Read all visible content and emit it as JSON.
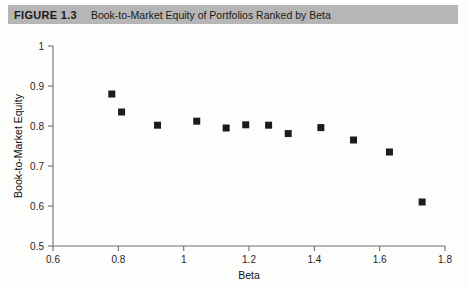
{
  "header": {
    "figure_number": "FIGURE 1.3",
    "title": "Book-to-Market Equity of Portfolios Ranked by Beta",
    "band_color": "#b6b6b6"
  },
  "chart_data": {
    "type": "scatter",
    "title": "Book-to-Market Equity of Portfolios Ranked by Beta",
    "xlabel": "Beta",
    "ylabel": "Book-to-Market Equity",
    "xlim": [
      0.6,
      1.8
    ],
    "ylim": [
      0.5,
      1.0
    ],
    "xticks": [
      0.6,
      0.8,
      1.0,
      1.2,
      1.4,
      1.6,
      1.8
    ],
    "xtick_labels": [
      "0.6",
      "0.8",
      "1",
      "1.2",
      "1.4",
      "1.6",
      "1.8"
    ],
    "yticks": [
      0.5,
      0.6,
      0.7,
      0.8,
      0.9,
      1.0
    ],
    "ytick_labels": [
      "0.5",
      "0.6",
      "0.7",
      "0.8",
      "0.9",
      "1"
    ],
    "grid": false,
    "legend": "none",
    "marker": "square",
    "marker_color": "#1c1c1c",
    "marker_size": 7,
    "x": [
      0.78,
      0.81,
      0.92,
      1.04,
      1.13,
      1.19,
      1.26,
      1.32,
      1.42,
      1.52,
      1.63,
      1.73
    ],
    "y": [
      0.88,
      0.835,
      0.802,
      0.812,
      0.795,
      0.803,
      0.802,
      0.781,
      0.796,
      0.765,
      0.735,
      0.61
    ],
    "points": [
      {
        "beta": 0.78,
        "bm": 0.88
      },
      {
        "beta": 0.81,
        "bm": 0.835
      },
      {
        "beta": 0.92,
        "bm": 0.802
      },
      {
        "beta": 1.04,
        "bm": 0.812
      },
      {
        "beta": 1.13,
        "bm": 0.795
      },
      {
        "beta": 1.19,
        "bm": 0.803
      },
      {
        "beta": 1.26,
        "bm": 0.802
      },
      {
        "beta": 1.32,
        "bm": 0.781
      },
      {
        "beta": 1.42,
        "bm": 0.796
      },
      {
        "beta": 1.52,
        "bm": 0.765
      },
      {
        "beta": 1.63,
        "bm": 0.735
      },
      {
        "beta": 1.73,
        "bm": 0.61
      }
    ]
  }
}
